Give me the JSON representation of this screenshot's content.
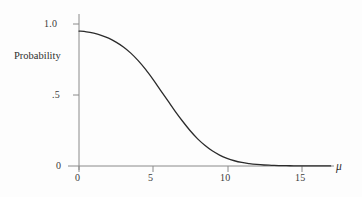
{
  "figure": {
    "background_color": "#fdfdfd",
    "line_color": "#2b2b2b",
    "axis_color": "#8a8a8a"
  },
  "axes": {
    "y_axis_title": "Probability",
    "x_axis_title": "μ",
    "y_ticks": [
      {
        "label": "1.0",
        "value": 1.0
      },
      {
        "label": ".5",
        "value": 0.5
      },
      {
        "label": "0",
        "value": 0.0
      }
    ],
    "x_ticks": [
      {
        "label": "0",
        "value": 0
      },
      {
        "label": "5",
        "value": 5
      },
      {
        "label": "10",
        "value": 10
      },
      {
        "label": "15",
        "value": 15
      }
    ]
  },
  "chart_data": {
    "type": "line",
    "title": "",
    "subtitle": "",
    "xlabel": "μ",
    "ylabel": "Probability",
    "xlim": [
      0,
      17
    ],
    "ylim": [
      0,
      1.05
    ],
    "grid": false,
    "legend": null,
    "x": [
      0,
      0.5,
      1,
      1.5,
      2,
      2.5,
      3,
      3.5,
      4,
      4.5,
      5,
      5.5,
      6,
      6.5,
      7,
      7.5,
      8,
      8.5,
      9,
      9.5,
      10,
      10.5,
      11,
      11.5,
      12,
      12.5,
      13,
      13.5,
      14,
      14.5,
      15,
      15.5,
      16,
      16.5,
      17
    ],
    "series": [
      {
        "name": "Probability",
        "values": [
          0.95,
          0.945,
          0.935,
          0.92,
          0.9,
          0.872,
          0.838,
          0.795,
          0.742,
          0.68,
          0.61,
          0.535,
          0.46,
          0.385,
          0.315,
          0.25,
          0.193,
          0.146,
          0.107,
          0.077,
          0.054,
          0.037,
          0.025,
          0.017,
          0.011,
          0.007,
          0.005,
          0.003,
          0.002,
          0.0015,
          0.001,
          0.0007,
          0.0005,
          0.0003,
          0.0002
        ]
      }
    ],
    "annotations": []
  }
}
